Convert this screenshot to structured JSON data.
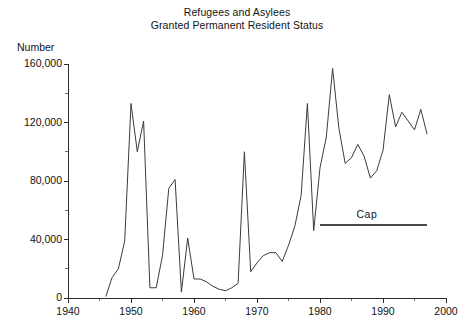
{
  "chart_data": {
    "type": "line",
    "title": "Refugees and Asylees Granted Permanent Resident Status",
    "title_lines": [
      "Refugees and Asylees",
      "Granted Permanent Resident Status"
    ],
    "xlabel": "",
    "ylabel": "Number",
    "xlim": [
      1940,
      2000
    ],
    "ylim": [
      0,
      160000
    ],
    "grid": false,
    "legend": "none",
    "x_ticks": [
      1940,
      1950,
      1960,
      1970,
      1980,
      1990,
      2000
    ],
    "x_tick_labels": [
      "1940",
      "1950",
      "1960",
      "1970",
      "1980",
      "1990",
      "2000"
    ],
    "x_minor_ticks": [
      1945,
      1955,
      1965,
      1975,
      1985,
      1995
    ],
    "y_ticks": [
      0,
      40000,
      80000,
      120000,
      160000
    ],
    "y_tick_labels": [
      "0",
      "40,000",
      "80,000",
      "120,000",
      "160,000"
    ],
    "y_minor_ticks": [
      20000,
      60000,
      100000,
      140000
    ],
    "x": [
      1946,
      1947,
      1948,
      1949,
      1950,
      1951,
      1952,
      1953,
      1954,
      1955,
      1956,
      1957,
      1958,
      1959,
      1960,
      1961,
      1962,
      1963,
      1964,
      1965,
      1966,
      1967,
      1968,
      1969,
      1970,
      1971,
      1972,
      1973,
      1974,
      1975,
      1976,
      1977,
      1978,
      1979,
      1980,
      1981,
      1982,
      1983,
      1984,
      1985,
      1986,
      1987,
      1988,
      1989,
      1990,
      1991,
      1992,
      1993,
      1994,
      1995,
      1996,
      1997
    ],
    "values": [
      1000,
      14000,
      20000,
      39000,
      133000,
      100000,
      121000,
      7000,
      7000,
      29000,
      75000,
      81000,
      4000,
      41000,
      13000,
      13000,
      11000,
      8000,
      6000,
      5000,
      7000,
      10000,
      100000,
      18000,
      24000,
      29000,
      31000,
      31000,
      25000,
      36000,
      49000,
      70000,
      133000,
      46000,
      89000,
      110000,
      157000,
      116000,
      92000,
      96000,
      105000,
      97000,
      82000,
      87000,
      101000,
      139000,
      117000,
      127000,
      121000,
      115000,
      129000,
      112000
    ],
    "annotations": [
      {
        "name": "cap",
        "label": "Cap",
        "value": 50000,
        "x_start": 1980,
        "x_end": 1997,
        "label_x": 1988
      }
    ]
  },
  "axis": {
    "y_title": "Number"
  }
}
